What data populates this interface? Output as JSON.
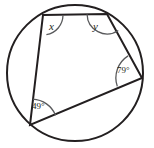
{
  "figure": {
    "type": "geometry-diagram",
    "width": 154,
    "height": 148,
    "background_color": "#ffffff",
    "stroke_color": "#231f20",
    "arc_color": "#58595b"
  },
  "circle": {
    "name": "circumscribed-circle",
    "center_x": 75,
    "center_y": 73,
    "radius": 68,
    "stroke_width": 2
  },
  "quadrilateral": {
    "name": "inscribed-quadrilateral",
    "stroke_width": 2,
    "vertices": [
      {
        "id": "top-left",
        "x": 43,
        "y": 15
      },
      {
        "id": "top-right",
        "x": 107,
        "y": 14
      },
      {
        "id": "right",
        "x": 142,
        "y": 78
      },
      {
        "id": "bottom-left",
        "x": 30,
        "y": 125
      }
    ],
    "path": "M 43 15 L 107 14 L 142 78 L 30 125 Z"
  },
  "angles": [
    {
      "id": "angle-x",
      "label": "x",
      "label_kind": "variable",
      "vertex": "top-left",
      "vertex_x": 43,
      "vertex_y": 15,
      "arc_radius": 20,
      "arc_path": "M 63 15.3 A 20 20 0 0 1 46.4 34.7",
      "label_x": 49,
      "label_y": 21
    },
    {
      "id": "angle-y",
      "label": "y",
      "label_kind": "variable",
      "vertex": "top-right",
      "vertex_x": 107,
      "vertex_y": 14,
      "arc_radius": 20,
      "arc_path": "M 118.3 30.5 A 20 20 0 0 1 87.1 14.3",
      "label_x": 93,
      "label_y": 21
    },
    {
      "id": "angle-79",
      "label": "79°",
      "label_kind": "measure",
      "value": 79,
      "unit": "degrees",
      "vertex": "right",
      "vertex_x": 142,
      "vertex_y": 78,
      "arc_radius": 26,
      "arc_path": "M 128.1 55.9 A 26 26 0 0 0 117.3 86.4",
      "label_x": 117,
      "label_y": 66
    },
    {
      "id": "angle-49",
      "label": "49°",
      "label_kind": "measure",
      "value": 49,
      "unit": "degrees",
      "vertex": "bottom-left",
      "vertex_x": 30,
      "vertex_y": 125,
      "arc_radius": 26,
      "arc_path": "M 32.7 99.2 A 26 26 0 0 1 55.6 115.3",
      "label_x": 32,
      "label_y": 102
    }
  ]
}
